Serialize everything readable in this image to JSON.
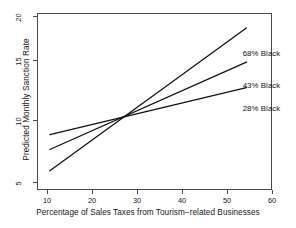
{
  "chart_data": {
    "type": "line",
    "title": "",
    "xlabel": "Percentage of Sales Taxes from Tourism−related Businesses",
    "ylabel": "Predicted Monthly Sanction Rate",
    "xlim": [
      7,
      62
    ],
    "ylim": [
      4.2,
      20.8
    ],
    "grid": false,
    "legend_position": "inline-right-annotations",
    "xticks": [
      10,
      20,
      30,
      40,
      50,
      60
    ],
    "xtick_labels": [
      "10",
      "20",
      "30",
      "40",
      "50",
      "60"
    ],
    "yticks": [
      5,
      10,
      15,
      20
    ],
    "ytick_labels": [
      "5",
      "10",
      "15",
      "20"
    ],
    "series": [
      {
        "name": "68% Black",
        "label": "68% Black",
        "color": "#111111",
        "x": [
          10,
          56
        ],
        "values": [
          6.0,
          19.4
        ]
      },
      {
        "name": "43% Black",
        "label": "43% Black",
        "color": "#111111",
        "x": [
          10,
          56
        ],
        "values": [
          8.0,
          16.2
        ]
      },
      {
        "name": "28% Black",
        "label": "28% Black",
        "color": "#111111",
        "x": [
          10,
          56
        ],
        "values": [
          9.4,
          13.8
        ]
      }
    ],
    "annotations": [
      {
        "text": "68% Black",
        "x": 57,
        "y": 17.0
      },
      {
        "text": "43% Black",
        "x": 57,
        "y": 14.0
      },
      {
        "text": "28% Black",
        "x": 57,
        "y": 11.8
      }
    ],
    "crossover_point": {
      "x": 27.5,
      "y": 11.0
    }
  },
  "axes": {
    "x_title": "Percentage of Sales Taxes from Tourism−related Businesses",
    "y_title": "Predicted Monthly Sanction Rate",
    "x_tick_labels": [
      "10",
      "20",
      "30",
      "40",
      "50",
      "60"
    ],
    "y_tick_labels": [
      "20",
      "15",
      "10",
      "5"
    ]
  },
  "labels": {
    "series_68": "68% Black",
    "series_43": "43% Black",
    "series_28": "28% Black"
  },
  "artifacts": {
    "page_bleed": ""
  }
}
